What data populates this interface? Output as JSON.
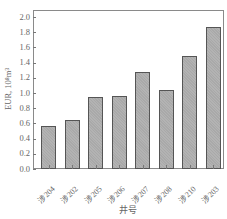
{
  "chart_data": {
    "type": "bar",
    "title": "",
    "xlabel": "井号",
    "ylabel": "EUR, 10⁸m³",
    "categories": [
      "涉204",
      "涉202",
      "涉205",
      "涉206",
      "涉207",
      "涉208",
      "涉210",
      "涉203"
    ],
    "values": [
      0.57,
      0.64,
      0.95,
      0.96,
      1.27,
      1.04,
      1.49,
      1.87
    ],
    "ylim": [
      0,
      2.0
    ],
    "yticks": [
      "0.0",
      "0.2",
      "0.4",
      "0.6",
      "0.8",
      "1.0",
      "1.2",
      "1.4",
      "1.6",
      "1.8",
      "2.0"
    ],
    "grid": false,
    "legend": null,
    "bar_color": "#a9a9a9",
    "bar_edge_color": "#555555"
  },
  "axes": {
    "ylabel": "EUR, 10⁸m³",
    "xlabel": "井号"
  }
}
